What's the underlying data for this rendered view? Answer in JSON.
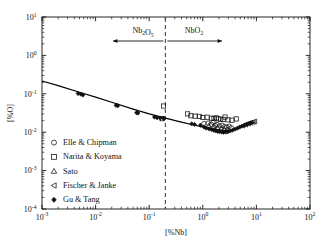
{
  "chart_data": {
    "type": "scatter",
    "title": "",
    "xlabel": "[%Nb]",
    "ylabel": "[%O]",
    "xscale": "log",
    "yscale": "log",
    "xlim": [
      0.001,
      100
    ],
    "ylim": [
      0.0001,
      10
    ],
    "grid": false,
    "legend_position": "lower-left",
    "xticks": [
      "10-3",
      "10-2",
      "10-1",
      "100",
      "101",
      "102"
    ],
    "xtick_mantissa": [
      "10",
      "10",
      "10",
      "10",
      "10",
      "10"
    ],
    "xtick_exponents": [
      "-3",
      "-2",
      "-1",
      "0",
      "1",
      "2"
    ],
    "ytick_mantissa": [
      "10",
      "10",
      "10",
      "10",
      "10",
      "10"
    ],
    "ytick_exponents": [
      "1",
      "0",
      "-1",
      "-2",
      "-3",
      "-4"
    ],
    "annotations": [
      {
        "text_main": "Nb",
        "text_sub": "2",
        "text_main2": "O",
        "text_sub2": "5",
        "label": "Nb2O5",
        "side": "left",
        "x": 0.06,
        "y": 2.6
      },
      {
        "text_main": "NbO",
        "text_sub": "2",
        "label": "NbO2",
        "side": "right",
        "x": 0.75,
        "y": 2.6
      }
    ],
    "phase_boundary_x": 0.2,
    "curve_name": "calculated solubility curve",
    "curve": [
      {
        "x": 0.001,
        "y": 0.215
      },
      {
        "x": 0.002,
        "y": 0.163
      },
      {
        "x": 0.005,
        "y": 0.11
      },
      {
        "x": 0.01,
        "y": 0.082
      },
      {
        "x": 0.02,
        "y": 0.06
      },
      {
        "x": 0.05,
        "y": 0.04
      },
      {
        "x": 0.1,
        "y": 0.03
      },
      {
        "x": 0.2,
        "y": 0.0232
      },
      {
        "x": 0.4,
        "y": 0.0183
      },
      {
        "x": 0.7,
        "y": 0.0152
      },
      {
        "x": 1.0,
        "y": 0.0138
      },
      {
        "x": 1.5,
        "y": 0.0123
      },
      {
        "x": 2.0,
        "y": 0.0115
      },
      {
        "x": 2.6,
        "y": 0.011
      },
      {
        "x": 3.2,
        "y": 0.0111
      },
      {
        "x": 4.0,
        "y": 0.0118
      },
      {
        "x": 5.0,
        "y": 0.013
      },
      {
        "x": 6.5,
        "y": 0.015
      },
      {
        "x": 8.0,
        "y": 0.0168
      },
      {
        "x": 9.5,
        "y": 0.0185
      }
    ],
    "series": [
      {
        "name": "Elle & Chipman",
        "marker": "circle-open",
        "points": [
          {
            "x": 1.05,
            "y": 0.0168
          },
          {
            "x": 1.25,
            "y": 0.0172
          },
          {
            "x": 1.45,
            "y": 0.016
          },
          {
            "x": 1.55,
            "y": 0.0182
          },
          {
            "x": 1.7,
            "y": 0.015
          },
          {
            "x": 1.85,
            "y": 0.0158
          },
          {
            "x": 2.05,
            "y": 0.0146
          },
          {
            "x": 2.3,
            "y": 0.0152
          },
          {
            "x": 2.55,
            "y": 0.014
          },
          {
            "x": 2.8,
            "y": 0.0136
          },
          {
            "x": 3.1,
            "y": 0.0143
          },
          {
            "x": 3.4,
            "y": 0.0131
          }
        ]
      },
      {
        "name": "Narita & Koyama",
        "marker": "square-open",
        "points": [
          {
            "x": 0.185,
            "y": 0.048
          },
          {
            "x": 0.175,
            "y": 0.0225
          },
          {
            "x": 0.52,
            "y": 0.03
          },
          {
            "x": 0.6,
            "y": 0.0268
          },
          {
            "x": 0.72,
            "y": 0.0262
          },
          {
            "x": 0.86,
            "y": 0.0258
          },
          {
            "x": 1.0,
            "y": 0.0242
          },
          {
            "x": 1.2,
            "y": 0.0246
          },
          {
            "x": 1.45,
            "y": 0.0232
          },
          {
            "x": 1.62,
            "y": 0.0228
          },
          {
            "x": 1.8,
            "y": 0.0236
          },
          {
            "x": 1.95,
            "y": 0.0222
          },
          {
            "x": 2.15,
            "y": 0.0218
          },
          {
            "x": 2.4,
            "y": 0.0215
          },
          {
            "x": 2.6,
            "y": 0.0248
          },
          {
            "x": 2.95,
            "y": 0.021
          },
          {
            "x": 3.5,
            "y": 0.0205
          },
          {
            "x": 4.2,
            "y": 0.0222
          }
        ]
      },
      {
        "name": "Sato",
        "marker": "triangle-open",
        "points": [
          {
            "x": 1.3,
            "y": 0.0148
          },
          {
            "x": 1.6,
            "y": 0.014
          },
          {
            "x": 1.9,
            "y": 0.0132
          },
          {
            "x": 2.2,
            "y": 0.0125
          },
          {
            "x": 2.5,
            "y": 0.012
          },
          {
            "x": 2.9,
            "y": 0.0116
          }
        ]
      },
      {
        "name": "Fischer & Janke",
        "marker": "triangle-left-open",
        "points": [
          {
            "x": 5.6,
            "y": 0.0148
          },
          {
            "x": 6.3,
            "y": 0.0158
          },
          {
            "x": 7.1,
            "y": 0.0166
          },
          {
            "x": 7.9,
            "y": 0.0175
          },
          {
            "x": 8.7,
            "y": 0.0184
          },
          {
            "x": 9.3,
            "y": 0.019
          }
        ]
      },
      {
        "name": "Gu & Tang",
        "marker": "diamond-filled",
        "points": [
          {
            "x": 0.0047,
            "y": 0.102
          },
          {
            "x": 0.0053,
            "y": 0.098
          },
          {
            "x": 0.0058,
            "y": 0.093
          },
          {
            "x": 0.024,
            "y": 0.05
          },
          {
            "x": 0.026,
            "y": 0.049
          },
          {
            "x": 0.058,
            "y": 0.0322
          },
          {
            "x": 0.062,
            "y": 0.0315
          },
          {
            "x": 0.125,
            "y": 0.0248
          },
          {
            "x": 0.14,
            "y": 0.0238
          },
          {
            "x": 0.16,
            "y": 0.0232
          },
          {
            "x": 0.185,
            "y": 0.0228
          },
          {
            "x": 0.62,
            "y": 0.0165
          },
          {
            "x": 0.7,
            "y": 0.016
          },
          {
            "x": 0.9,
            "y": 0.0152
          },
          {
            "x": 1.05,
            "y": 0.0136
          },
          {
            "x": 1.15,
            "y": 0.0128
          },
          {
            "x": 1.3,
            "y": 0.0122
          },
          {
            "x": 1.45,
            "y": 0.0118
          },
          {
            "x": 1.6,
            "y": 0.0112
          },
          {
            "x": 1.75,
            "y": 0.0108
          },
          {
            "x": 1.9,
            "y": 0.0105
          },
          {
            "x": 2.05,
            "y": 0.0104
          },
          {
            "x": 2.25,
            "y": 0.0101
          },
          {
            "x": 2.45,
            "y": 0.01
          },
          {
            "x": 2.7,
            "y": 0.0101
          },
          {
            "x": 2.95,
            "y": 0.0103
          },
          {
            "x": 3.25,
            "y": 0.0108
          },
          {
            "x": 3.6,
            "y": 0.0113
          },
          {
            "x": 4.0,
            "y": 0.012
          },
          {
            "x": 4.45,
            "y": 0.0128
          },
          {
            "x": 4.9,
            "y": 0.0136
          },
          {
            "x": 5.4,
            "y": 0.0144
          },
          {
            "x": 6.0,
            "y": 0.0153
          },
          {
            "x": 6.6,
            "y": 0.0162
          },
          {
            "x": 7.3,
            "y": 0.017
          },
          {
            "x": 8.0,
            "y": 0.0178
          }
        ]
      }
    ]
  },
  "legend": {
    "items": [
      {
        "label": "Elle & Chipman",
        "marker": "circle-open"
      },
      {
        "label": "Narita & Koyama",
        "marker": "square-open"
      },
      {
        "label": "Sato",
        "marker": "triangle-open"
      },
      {
        "label": "Fischer & Janke",
        "marker": "triangle-left-open"
      },
      {
        "label": "Gu & Tang",
        "marker": "diamond-filled"
      }
    ]
  },
  "colors": {
    "axis": "#111111",
    "marker": "#111111",
    "curve": "#000000",
    "background": "#ffffff"
  }
}
